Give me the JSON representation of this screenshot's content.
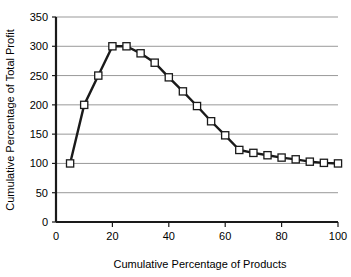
{
  "chart_data": {
    "type": "line",
    "title": "",
    "subtitle": "",
    "xlabel": "Cumulative Percentage of Products",
    "ylabel": "Cumulative Percentage of Total Profit",
    "xlim": [
      0,
      100
    ],
    "ylim": [
      0,
      350
    ],
    "xticks": [
      0,
      20,
      40,
      60,
      80,
      100
    ],
    "yticks": [
      0,
      50,
      100,
      150,
      200,
      250,
      300,
      350
    ],
    "xticklabels": [
      "0",
      "20",
      "40",
      "60",
      "80",
      "100"
    ],
    "yticklabels": [
      "0",
      "50",
      "100",
      "150",
      "200",
      "250",
      "300",
      "350"
    ],
    "grid": "horizontal",
    "legend": "none",
    "marker": "open-square",
    "line_color": "#1a1a1a",
    "marker_fill": "#ffffff",
    "marker_edge": "#1a1a1a",
    "grid_color": "#999999",
    "axis_color": "#1a1a1a",
    "x": [
      5,
      10,
      15,
      20,
      25,
      30,
      35,
      40,
      45,
      50,
      55,
      60,
      65,
      70,
      75,
      80,
      85,
      90,
      95,
      100
    ],
    "values": [
      100,
      200,
      250,
      300,
      300,
      288,
      272,
      247,
      223,
      198,
      172,
      148,
      123,
      118,
      114,
      110,
      107,
      103,
      101,
      100
    ],
    "series": [
      {
        "name": "Cumulative Percentage of Total Profit",
        "values": [
          100,
          200,
          250,
          300,
          300,
          288,
          272,
          247,
          223,
          198,
          172,
          148,
          123,
          118,
          114,
          110,
          107,
          103,
          101,
          100
        ]
      }
    ],
    "annotations": []
  }
}
